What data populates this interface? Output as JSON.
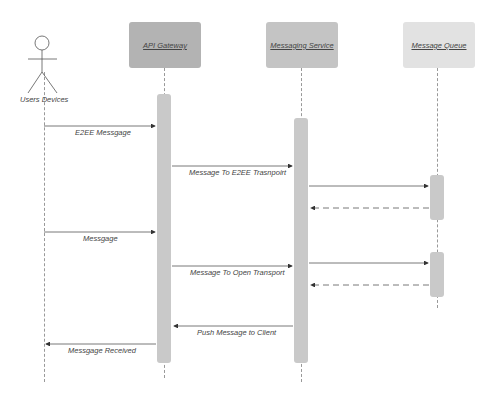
{
  "diagram": {
    "type": "sequence",
    "actor": {
      "label": "Users Devices"
    },
    "participants": [
      {
        "label": "API Gateway",
        "color": "#b3b3b3"
      },
      {
        "label": "Messaging Service",
        "color": "#c4c4c4"
      },
      {
        "label": "Message Queue",
        "color": "#e0e0e0"
      }
    ],
    "messages": [
      {
        "from": "Users Devices",
        "to": "API Gateway",
        "label": "E2EE Messgage",
        "style": "solid"
      },
      {
        "from": "API Gateway",
        "to": "Messaging Service",
        "label": "Message To E2EE Trasnpoirt",
        "style": "solid"
      },
      {
        "from": "Messaging Service",
        "to": "Message Queue",
        "label": "",
        "style": "solid"
      },
      {
        "from": "Message Queue",
        "to": "Messaging Service",
        "label": "",
        "style": "dashed"
      },
      {
        "from": "Users Devices",
        "to": "API Gateway",
        "label": "Messgage",
        "style": "solid"
      },
      {
        "from": "API Gateway",
        "to": "Messaging Service",
        "label": "Message To Open Transport",
        "style": "solid"
      },
      {
        "from": "Messaging Service",
        "to": "Message Queue",
        "label": "",
        "style": "solid"
      },
      {
        "from": "Message Queue",
        "to": "Messaging Service",
        "label": "",
        "style": "dashed"
      },
      {
        "from": "Messaging Service",
        "to": "API Gateway",
        "label": "Push Message to Client",
        "style": "solid"
      },
      {
        "from": "API Gateway",
        "to": "Users Devices",
        "label": "Messgage Received",
        "style": "solid"
      }
    ]
  }
}
